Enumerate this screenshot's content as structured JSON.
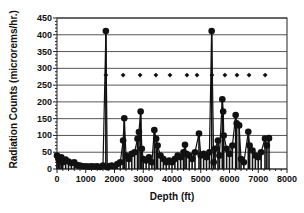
{
  "chart_data": {
    "type": "scatter",
    "title": "",
    "xlabel": "Depth (ft)",
    "ylabel": "Radiation Counts (microrems/hr.)",
    "xlim": [
      0,
      8000
    ],
    "ylim": [
      0,
      450
    ],
    "x_ticks": [
      0,
      1000,
      2000,
      3000,
      4000,
      5000,
      6000,
      7000,
      8000
    ],
    "y_ticks": [
      0,
      50,
      100,
      150,
      200,
      250,
      300,
      350,
      400,
      450
    ],
    "grid": "horizontal",
    "legend": null,
    "series": [
      {
        "name": "Radiation counts",
        "style": "markers with vertical stems",
        "color": "#111111",
        "points": [
          [
            0,
            40
          ],
          [
            50,
            30
          ],
          [
            100,
            25
          ],
          [
            150,
            35
          ],
          [
            200,
            20
          ],
          [
            300,
            28
          ],
          [
            400,
            22
          ],
          [
            500,
            18
          ],
          [
            600,
            20
          ],
          [
            700,
            12
          ],
          [
            800,
            10
          ],
          [
            900,
            8
          ],
          [
            1000,
            8
          ],
          [
            1100,
            7
          ],
          [
            1200,
            8
          ],
          [
            1300,
            7
          ],
          [
            1400,
            8
          ],
          [
            1500,
            6
          ],
          [
            1600,
            10
          ],
          [
            1700,
            411
          ],
          [
            1750,
            5
          ],
          [
            1800,
            8
          ],
          [
            1900,
            10
          ],
          [
            2000,
            8
          ],
          [
            2100,
            15
          ],
          [
            2200,
            20
          ],
          [
            2300,
            85
          ],
          [
            2340,
            151
          ],
          [
            2400,
            40
          ],
          [
            2500,
            30
          ],
          [
            2600,
            45
          ],
          [
            2700,
            50
          ],
          [
            2800,
            90
          ],
          [
            2850,
            110
          ],
          [
            2910,
            171
          ],
          [
            2950,
            60
          ],
          [
            3000,
            30
          ],
          [
            3100,
            25
          ],
          [
            3200,
            35
          ],
          [
            3300,
            20
          ],
          [
            3385,
            116
          ],
          [
            3450,
            90
          ],
          [
            3500,
            70
          ],
          [
            3600,
            40
          ],
          [
            3700,
            30
          ],
          [
            3800,
            20
          ],
          [
            3900,
            25
          ],
          [
            4000,
            20
          ],
          [
            4100,
            30
          ],
          [
            4200,
            40
          ],
          [
            4300,
            35
          ],
          [
            4400,
            50
          ],
          [
            4452,
            72
          ],
          [
            4500,
            45
          ],
          [
            4600,
            40
          ],
          [
            4700,
            30
          ],
          [
            4800,
            50
          ],
          [
            4939,
            106
          ],
          [
            5000,
            40
          ],
          [
            5100,
            45
          ],
          [
            5200,
            35
          ],
          [
            5300,
            50
          ],
          [
            5380,
            411
          ],
          [
            5450,
            20
          ],
          [
            5500,
            60
          ],
          [
            5600,
            85
          ],
          [
            5650,
            40
          ],
          [
            5750,
            208
          ],
          [
            5780,
            171
          ],
          [
            5800,
            100
          ],
          [
            5900,
            60
          ],
          [
            6000,
            45
          ],
          [
            6100,
            70
          ],
          [
            6215,
            161
          ],
          [
            6250,
            136
          ],
          [
            6335,
            130
          ],
          [
            6400,
            30
          ],
          [
            6500,
            20
          ],
          [
            6654,
            111
          ],
          [
            6700,
            70
          ],
          [
            6800,
            55
          ],
          [
            6900,
            40
          ],
          [
            7000,
            35
          ],
          [
            7100,
            50
          ],
          [
            7235,
            91
          ],
          [
            7300,
            70
          ],
          [
            7374,
            92
          ]
        ]
      },
      {
        "name": "Reference markers",
        "style": "diamond markers",
        "color": "#111111",
        "points": [
          [
            1700,
            280
          ],
          [
            2300,
            280
          ],
          [
            2890,
            280
          ],
          [
            3440,
            280
          ],
          [
            3930,
            280
          ],
          [
            4520,
            280
          ],
          [
            4870,
            280
          ],
          [
            5390,
            280
          ],
          [
            5840,
            280
          ],
          [
            6260,
            280
          ],
          [
            6680,
            280
          ],
          [
            7240,
            280
          ]
        ]
      }
    ]
  }
}
